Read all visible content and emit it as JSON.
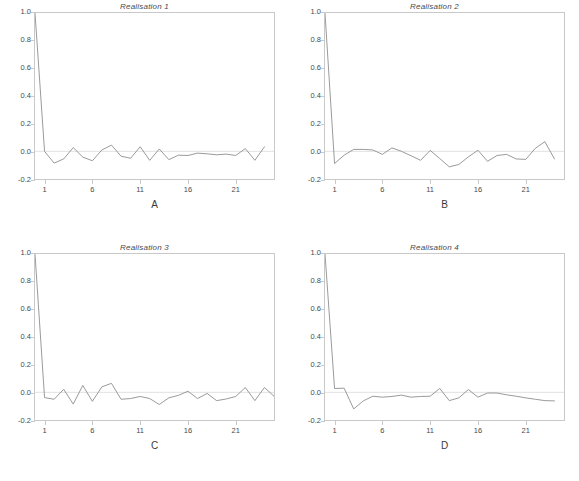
{
  "figure": {
    "background_color": "#ffffff",
    "line_color": "#8e8e8e",
    "axis_color": "#c9c9c9",
    "zero_line_color": "#d8d8d8",
    "layout": "2x2 grid of autocorrelation panels"
  },
  "chart_data": [
    {
      "type": "line",
      "title": "Realisation 1",
      "xlabel": "A",
      "ylabel": "",
      "xlim": [
        0,
        25
      ],
      "ylim": [
        -0.2,
        1.0
      ],
      "grid": false,
      "legend": "none",
      "xticks": [
        1,
        6,
        11,
        16,
        21
      ],
      "xtick_labels": [
        "1",
        "6",
        "11",
        "16",
        "21"
      ],
      "yticks": [
        -0.2,
        0.0,
        0.2,
        0.4,
        0.6,
        0.8,
        1.0
      ],
      "ytick_labels": [
        "-0.2",
        "0.0",
        "0.2",
        "0.4",
        "0.6",
        "0.8",
        "1.0"
      ],
      "zero_reference_line": 0.0,
      "x": [
        0,
        1,
        2,
        3,
        4,
        5,
        6,
        7,
        8,
        9,
        10,
        11,
        12,
        13,
        14,
        15,
        16,
        17,
        18,
        19,
        20,
        21,
        22,
        23,
        24
      ],
      "values": [
        1.0,
        0.0,
        -0.085,
        -0.055,
        0.027,
        -0.042,
        -0.068,
        0.01,
        0.045,
        -0.035,
        -0.05,
        0.033,
        -0.065,
        0.017,
        -0.06,
        -0.028,
        -0.03,
        -0.013,
        -0.018,
        -0.025,
        -0.02,
        -0.03,
        0.02,
        -0.065,
        0.033
      ]
    },
    {
      "type": "line",
      "title": "Realisation 2",
      "xlabel": "B",
      "ylabel": "",
      "xlim": [
        0,
        25
      ],
      "ylim": [
        -0.2,
        1.0
      ],
      "grid": false,
      "legend": "none",
      "xticks": [
        1,
        6,
        11,
        16,
        21
      ],
      "xtick_labels": [
        "1",
        "6",
        "11",
        "16",
        "21"
      ],
      "yticks": [
        -0.2,
        0.0,
        0.2,
        0.4,
        0.6,
        0.8,
        1.0
      ],
      "ytick_labels": [
        "-0.2",
        "0.0",
        "0.2",
        "0.4",
        "0.6",
        "0.8",
        "1.0"
      ],
      "zero_reference_line": 0.0,
      "x": [
        0,
        1,
        2,
        3,
        4,
        5,
        6,
        7,
        8,
        9,
        10,
        11,
        12,
        13,
        14,
        15,
        16,
        17,
        18,
        19,
        20,
        21,
        22,
        23,
        24
      ],
      "values": [
        1.0,
        -0.088,
        -0.028,
        0.014,
        0.014,
        0.01,
        -0.022,
        0.025,
        0.0,
        -0.032,
        -0.065,
        0.007,
        -0.052,
        -0.112,
        -0.095,
        -0.04,
        0.008,
        -0.072,
        -0.03,
        -0.022,
        -0.055,
        -0.058,
        0.022,
        0.07,
        -0.055
      ]
    },
    {
      "type": "line",
      "title": "Realisation 3",
      "xlabel": "C",
      "ylabel": "",
      "xlim": [
        0,
        25
      ],
      "ylim": [
        -0.2,
        1.0
      ],
      "grid": false,
      "legend": "none",
      "xticks": [
        1,
        6,
        11,
        16,
        21
      ],
      "xtick_labels": [
        "1",
        "6",
        "11",
        "16",
        "21"
      ],
      "yticks": [
        -0.2,
        0.0,
        0.2,
        0.4,
        0.6,
        0.8,
        1.0
      ],
      "ytick_labels": [
        "-0.2",
        "0.0",
        "0.2",
        "0.4",
        "0.6",
        "0.8",
        "1.0"
      ],
      "zero_reference_line": 0.0,
      "x": [
        0,
        1,
        2,
        3,
        4,
        5,
        6,
        7,
        8,
        9,
        10,
        11,
        12,
        13,
        14,
        15,
        16,
        17,
        18,
        19,
        20,
        21,
        22,
        23,
        24
      ],
      "values": [
        1.0,
        -0.038,
        -0.05,
        0.022,
        -0.085,
        0.05,
        -0.065,
        0.04,
        0.065,
        -0.05,
        -0.045,
        -0.03,
        -0.045,
        -0.088,
        -0.04,
        -0.022,
        0.008,
        -0.045,
        -0.008,
        -0.06,
        -0.048,
        -0.03,
        0.035,
        -0.06,
        0.035,
        -0.028
      ]
    },
    {
      "type": "line",
      "title": "Realisation 4",
      "xlabel": "D",
      "ylabel": "",
      "xlim": [
        0,
        25
      ],
      "ylim": [
        -0.2,
        1.0
      ],
      "grid": false,
      "legend": "none",
      "xticks": [
        1,
        6,
        11,
        16,
        21
      ],
      "xtick_labels": [
        "1",
        "6",
        "11",
        "16",
        "21"
      ],
      "yticks": [
        -0.2,
        0.0,
        0.2,
        0.4,
        0.6,
        0.8,
        1.0
      ],
      "ytick_labels": [
        "-0.2",
        "0.0",
        "0.2",
        "0.4",
        "0.6",
        "0.8",
        "1.0"
      ],
      "zero_reference_line": 0.0,
      "x": [
        0,
        1,
        2,
        3,
        4,
        5,
        6,
        7,
        8,
        9,
        10,
        11,
        12,
        13,
        14,
        15,
        16,
        17,
        18,
        19,
        20,
        21,
        22,
        23,
        24
      ],
      "values": [
        1.0,
        0.028,
        0.03,
        -0.12,
        -0.062,
        -0.028,
        -0.035,
        -0.03,
        -0.02,
        -0.035,
        -0.03,
        -0.028,
        0.028,
        -0.06,
        -0.04,
        0.02,
        -0.035,
        -0.005,
        -0.005,
        -0.018,
        -0.028,
        -0.04,
        -0.05,
        -0.06,
        -0.062
      ]
    }
  ]
}
